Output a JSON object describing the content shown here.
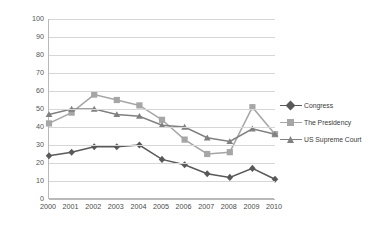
{
  "chart_data": {
    "type": "line",
    "title": "",
    "xlabel": "",
    "ylabel": "percent answering \"Great Deal\"/\"Quite A Lot\"",
    "categories": [
      "2000",
      "2001",
      "2002",
      "2003",
      "2004",
      "2005",
      "2006",
      "2007",
      "2008",
      "2009",
      "2010"
    ],
    "ylim": [
      0,
      100
    ],
    "yticks": [
      0,
      10,
      20,
      30,
      40,
      50,
      60,
      70,
      80,
      90,
      100
    ],
    "grid": true,
    "legend_position": "right",
    "series": [
      {
        "name": "Congress",
        "color": "#595959",
        "marker": "diamond",
        "values": [
          24,
          26,
          29,
          29,
          30,
          22,
          19,
          14,
          12,
          17,
          11
        ]
      },
      {
        "name": "The Presidency",
        "color": "#a6a6a6",
        "marker": "square",
        "values": [
          42,
          48,
          58,
          55,
          52,
          44,
          33,
          25,
          26,
          51,
          36
        ]
      },
      {
        "name": "US Supreme Court",
        "color": "#808080",
        "marker": "triangle",
        "values": [
          47,
          50,
          50,
          47,
          46,
          41,
          40,
          34,
          32,
          39,
          36
        ]
      }
    ]
  },
  "legend": {
    "items": [
      {
        "label": "Congress"
      },
      {
        "label": "The Presidency"
      },
      {
        "label": "US Supreme Court"
      }
    ]
  },
  "axes": {
    "y_label": "percent answering \"Great Deal\"/\"Quite A Lot\"",
    "y_tick_labels": [
      "100",
      "90",
      "80",
      "70",
      "60",
      "50",
      "40",
      "30",
      "20",
      "10",
      "0"
    ],
    "x_tick_labels": [
      "2000",
      "2001",
      "2002",
      "2003",
      "2004",
      "2005",
      "2006",
      "2007",
      "2008",
      "2009",
      "2010"
    ]
  },
  "colors": {
    "congress": "#595959",
    "presidency": "#a6a6a6",
    "supreme_court": "#808080",
    "gridline": "#d6d6d6",
    "axis": "#b9b9b9",
    "plot_background": "#ffffff"
  }
}
